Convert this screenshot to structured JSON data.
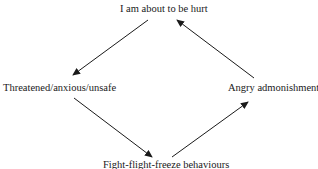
{
  "diagram": {
    "type": "cycle",
    "nodes": [
      {
        "id": "top",
        "label": "I am about to be hurt"
      },
      {
        "id": "left",
        "label": "Threatened/anxious/unsafe"
      },
      {
        "id": "bottom",
        "label": "Fight-flight-freeze behaviours"
      },
      {
        "id": "right",
        "label": "Angry admonishment"
      }
    ],
    "edges": [
      {
        "from": "top",
        "to": "left"
      },
      {
        "from": "left",
        "to": "bottom"
      },
      {
        "from": "bottom",
        "to": "right"
      },
      {
        "from": "right",
        "to": "top"
      }
    ],
    "colors": {
      "line": "#1a1a1a",
      "text": "#1a1a1a",
      "background": "#ffffff"
    }
  }
}
